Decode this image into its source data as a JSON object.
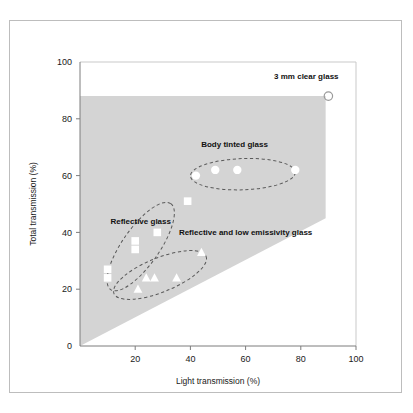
{
  "figure": {
    "border_color": "#bdbdbd",
    "background": "#ffffff"
  },
  "chart_data": {
    "type": "scatter",
    "title": "",
    "subtitle": "",
    "xlabel": "Light transmission (%)",
    "ylabel": "Total transmission (%)",
    "xlim": [
      0,
      100
    ],
    "ylim": [
      0,
      100
    ],
    "xticks": [
      0,
      20,
      40,
      60,
      80,
      100
    ],
    "yticks": [
      0,
      20,
      40,
      60,
      80,
      100
    ],
    "xtick_labels": [
      "",
      "20",
      "40",
      "60",
      "80",
      "100"
    ],
    "ytick_labels": [
      "0",
      "20",
      "40",
      "60",
      "80",
      "100"
    ],
    "grid": false,
    "legend": "none",
    "shaded_region": {
      "name": "feasible-glass-performance-region",
      "color": "#d4d4d4",
      "vertices": [
        [
          0,
          0
        ],
        [
          0,
          88
        ],
        [
          89,
          88
        ],
        [
          89,
          45
        ]
      ]
    },
    "series": [
      {
        "name": "Body tinted glass",
        "marker": "circle",
        "marker_color": "#ffffff",
        "points": [
          [
            42,
            60
          ],
          [
            49,
            62
          ],
          [
            57,
            62
          ],
          [
            78,
            62
          ]
        ]
      },
      {
        "name": "Reflective glass",
        "marker": "square",
        "marker_color": "#ffffff",
        "points": [
          [
            10,
            27
          ],
          [
            10,
            24
          ],
          [
            20,
            37
          ],
          [
            20,
            34
          ],
          [
            28,
            40
          ],
          [
            39,
            51
          ]
        ]
      },
      {
        "name": "Reflective and low emissivity glass",
        "marker": "triangle",
        "marker_color": "#ffffff",
        "points": [
          [
            21,
            20
          ],
          [
            24,
            24
          ],
          [
            27,
            24
          ],
          [
            35,
            24
          ],
          [
            44,
            33
          ]
        ]
      },
      {
        "name": "3 mm clear glass",
        "marker": "circle-open",
        "marker_color": "#9a9a9a",
        "points": [
          [
            90,
            88
          ]
        ]
      }
    ],
    "annotations": [
      {
        "label": "3 mm clear glass",
        "x": 82,
        "y": 94,
        "anchor": "middle",
        "ellipse": null
      },
      {
        "label": "Body tinted glass",
        "x": 56,
        "y": 70,
        "anchor": "middle",
        "ellipse": {
          "cx": 59,
          "cy": 60.5,
          "rx": 19,
          "ry": 5.5,
          "rotate": -2
        }
      },
      {
        "label": "Reflective glass",
        "x": 22,
        "y": 43,
        "anchor": "middle",
        "ellipse": {
          "cx": 22,
          "cy": 35,
          "rx": 19,
          "ry": 6.5,
          "rotate": -55
        }
      },
      {
        "label": "Reflective and low emissivity glass",
        "x": 60,
        "y": 39,
        "anchor": "middle",
        "ellipse": {
          "cx": 29,
          "cy": 25,
          "rx": 18,
          "ry": 6,
          "rotate": -22
        }
      }
    ]
  }
}
